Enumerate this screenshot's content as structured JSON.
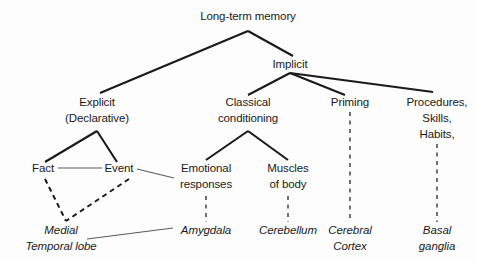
{
  "diagram": {
    "background_color": "#fdfdfd",
    "line_color": "#1a1a1a",
    "thin_line_color": "#5a5a5a",
    "text_color": "#1a1a1a",
    "nodes": {
      "root": {
        "label": "Long-term memory",
        "x": 248,
        "y": 20
      },
      "explicit_line1": {
        "label": "Explicit",
        "x": 97,
        "y": 106
      },
      "explicit_line2": {
        "label": "(Declarative)",
        "x": 97,
        "y": 122
      },
      "implicit": {
        "label": "Implicit",
        "x": 290,
        "y": 68
      },
      "classical_line1": {
        "label": "Classical",
        "x": 248,
        "y": 106
      },
      "classical_line2": {
        "label": "conditioning",
        "x": 248,
        "y": 122
      },
      "priming": {
        "label": "Priming",
        "x": 350,
        "y": 106
      },
      "procedures_line1": {
        "label": "Procedures,",
        "x": 437,
        "y": 106
      },
      "procedures_line2": {
        "label": "Skills,",
        "x": 437,
        "y": 122
      },
      "procedures_line3": {
        "label": "Habits,",
        "x": 437,
        "y": 138
      },
      "fact": {
        "label": "Fact",
        "x": 43,
        "y": 172
      },
      "event": {
        "label": "Event",
        "x": 119,
        "y": 172
      },
      "emotional_line1": {
        "label": "Emotional",
        "x": 206,
        "y": 172
      },
      "emotional_line2": {
        "label": "responses",
        "x": 206,
        "y": 188
      },
      "muscles_line1": {
        "label": "Muscles",
        "x": 288,
        "y": 172
      },
      "muscles_line2": {
        "label": "of body",
        "x": 288,
        "y": 188
      },
      "medial_line1": {
        "label": "Medial",
        "x": 61,
        "y": 234
      },
      "medial_line2": {
        "label": "Temporal lobe",
        "x": 61,
        "y": 250
      },
      "amygdala": {
        "label": "Amygdala",
        "x": 206,
        "y": 234
      },
      "cerebellum": {
        "label": "Cerebellum",
        "x": 288,
        "y": 234
      },
      "cerebral_line1": {
        "label": "Cerebral",
        "x": 350,
        "y": 234
      },
      "cerebral_line2": {
        "label": "Cortex",
        "x": 350,
        "y": 250
      },
      "basal_line1": {
        "label": "Basal",
        "x": 437,
        "y": 234
      },
      "basal_line2": {
        "label": "ganglia",
        "x": 437,
        "y": 250
      }
    },
    "edges": {
      "root_to_explicit": {
        "kind": "solid-thick",
        "points": "248,31 100,93"
      },
      "root_to_implicit": {
        "kind": "solid-thick",
        "points": "248,31 293,56"
      },
      "implicit_to_classical": {
        "kind": "solid-thick",
        "points": "290,73 248,95"
      },
      "implicit_to_priming": {
        "kind": "solid-thick",
        "points": "290,73 345,95"
      },
      "implicit_to_procedures": {
        "kind": "solid-thick",
        "points": "290,73 433,92"
      },
      "explicit_to_fact": {
        "kind": "solid-thick",
        "points": "97,131 45,162"
      },
      "explicit_to_event": {
        "kind": "solid-thick",
        "points": "97,131 117,162"
      },
      "fact_to_event": {
        "kind": "solid-thin",
        "points": "58,168 102,168"
      },
      "classical_to_emotional": {
        "kind": "solid-thick",
        "points": "248,131 206,160"
      },
      "classical_to_muscles": {
        "kind": "solid-thick",
        "points": "248,131 288,160"
      },
      "event_to_emotional": {
        "kind": "solid-thin",
        "points": "137,169 174,178"
      },
      "fact_to_medial": {
        "kind": "dashed-thick",
        "points": "45,179 66,221"
      },
      "event_to_medial": {
        "kind": "dashed-thick",
        "points": "129,179 66,221"
      },
      "medial_to_amygdala": {
        "kind": "solid-thin",
        "points": "87,239 173,228"
      },
      "emotional_to_amygdala": {
        "kind": "dashed-thin",
        "points": "206,196 206,222"
      },
      "muscles_to_cerebellum": {
        "kind": "dashed-thin",
        "points": "288,196 288,222"
      },
      "priming_to_cerebral": {
        "kind": "dashed-thin",
        "points": "350,112 350,222"
      },
      "procedures_to_basal": {
        "kind": "dashed-thin",
        "points": "437,144 437,222"
      }
    }
  }
}
